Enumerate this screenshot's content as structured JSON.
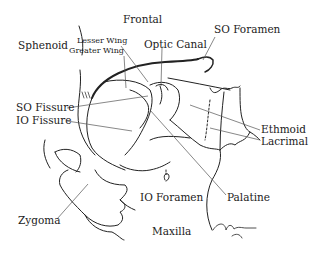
{
  "diagram": {
    "labels": {
      "frontal": "Frontal",
      "sphenoid": "Sphenoid",
      "lesser_wing": "Lesser Wing",
      "greater_wing": "Greater Wing",
      "optic_canal": "Optic Canal",
      "so_foramen": "SO Foramen",
      "so_fissure": "SO Fissure",
      "io_fissure": "IO Fissure",
      "ethmoid": "Ethmoid",
      "lacrimal": "Lacrimal",
      "io_foramen": "IO Foramen",
      "palatine": "Palatine",
      "zygoma": "Zygoma",
      "maxilla": "Maxilla"
    },
    "line_color": "#222222",
    "background": "#ffffff"
  }
}
